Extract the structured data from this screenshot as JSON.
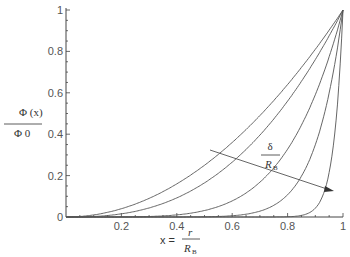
{
  "chart_data": {
    "type": "line",
    "title": "",
    "xlabel": "x = r / R_B",
    "ylabel": "Φ(x) / Φ_0",
    "xlim": [
      0,
      1
    ],
    "ylim": [
      0,
      1
    ],
    "x_ticks": [
      "0.2",
      "0.4",
      "0.6",
      "0.8",
      "1"
    ],
    "y_ticks": [
      "0",
      "0.2",
      "0.4",
      "0.6",
      "0.8",
      "1"
    ],
    "grid": false,
    "annotation": {
      "text": "δ / R_B",
      "arrow": "decreasing δ/R_B direction"
    },
    "series": [
      {
        "name": "curve 1",
        "exponent": 2,
        "x": [
          0,
          0.2,
          0.4,
          0.6,
          0.8,
          1
        ],
        "values": [
          0,
          0.04,
          0.16,
          0.36,
          0.64,
          1
        ]
      },
      {
        "name": "curve 2",
        "exponent": 2.6,
        "x": [
          0,
          0.2,
          0.4,
          0.6,
          0.8,
          1
        ],
        "values": [
          0,
          0.015,
          0.09,
          0.26,
          0.56,
          1
        ]
      },
      {
        "name": "curve 3",
        "exponent": 5,
        "x": [
          0,
          0.2,
          0.4,
          0.6,
          0.8,
          1
        ],
        "values": [
          0,
          0.0,
          0.01,
          0.08,
          0.33,
          1
        ]
      },
      {
        "name": "curve 4",
        "exponent": 10,
        "x": [
          0,
          0.2,
          0.4,
          0.6,
          0.8,
          1
        ],
        "values": [
          0,
          0,
          0,
          0.006,
          0.11,
          1
        ]
      },
      {
        "name": "curve 5",
        "exponent": 30,
        "x": [
          0,
          0.2,
          0.4,
          0.6,
          0.8,
          1
        ],
        "values": [
          0,
          0,
          0,
          0,
          0.001,
          1
        ]
      }
    ]
  },
  "labels": {
    "y_num": "Φ (x)",
    "y_den": "Φ 0",
    "x_prefix": "x =",
    "x_num": "r",
    "x_den": "R",
    "x_den_sub": "B",
    "ann_num": "δ",
    "ann_den": "R",
    "ann_den_sub": "B"
  }
}
